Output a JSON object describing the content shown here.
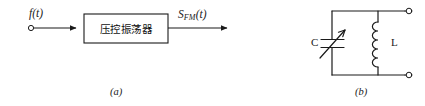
{
  "figure": {
    "panels": [
      {
        "id": "a",
        "caption": "(a)",
        "type": "block-diagram",
        "title": "Voltage controlled oscillator block diagram",
        "block": {
          "label": "压控振荡器",
          "meaning": "voltage-controlled oscillator"
        },
        "input": {
          "label": "f(t)",
          "terminal": "open-circle"
        },
        "output": {
          "label_base": "S",
          "label_sub": "FM",
          "label_tail": "(t)",
          "terminal": "arrow"
        }
      },
      {
        "id": "b",
        "caption": "(b)",
        "type": "circuit-schematic",
        "title": "Parallel LC tank circuit",
        "components": [
          {
            "designator": "C",
            "kind": "variable-capacitor",
            "symbol": "two-plates-with-arrow"
          },
          {
            "designator": "L",
            "kind": "inductor",
            "symbol": "coil",
            "turns": 5
          }
        ],
        "terminals": [
          {
            "position": "top-right",
            "style": "open-circle"
          },
          {
            "position": "bottom-right",
            "style": "open-circle"
          }
        ]
      }
    ],
    "colors": {
      "background": "#ffffff",
      "stroke": "#1a1a1a",
      "text": "#1a1a1a"
    }
  }
}
